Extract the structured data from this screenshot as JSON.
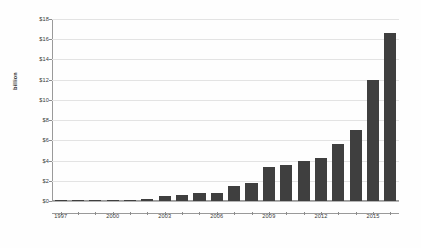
{
  "chart_data": {
    "type": "bar",
    "title": "",
    "subtitle": "",
    "xlabel": "",
    "ylabel": "billion",
    "categories": [
      "1997",
      "1998",
      "1999",
      "2000",
      "2001",
      "2002",
      "2003",
      "2004",
      "2005",
      "2006",
      "2007",
      "2008",
      "2009",
      "2010",
      "2011",
      "2012",
      "2013",
      "2014",
      "2015",
      "2016"
    ],
    "values": [
      0.05,
      0.02,
      0.03,
      0.03,
      0.03,
      0.2,
      0.45,
      0.55,
      0.8,
      0.75,
      1.5,
      1.8,
      3.4,
      3.55,
      4.0,
      4.3,
      5.6,
      7.0,
      12.0,
      16.6
    ],
    "series": [
      {
        "name": "billion",
        "values": [
          0.05,
          0.02,
          0.03,
          0.03,
          0.03,
          0.2,
          0.45,
          0.55,
          0.8,
          0.75,
          1.5,
          1.8,
          3.4,
          3.55,
          4.0,
          4.3,
          5.6,
          7.0,
          12.0,
          16.6
        ]
      }
    ],
    "ylim": [
      0,
      18
    ],
    "ytick_values": [
      0,
      2,
      4,
      6,
      8,
      10,
      12,
      14,
      16,
      18
    ],
    "ytick_labels": [
      "$0",
      "$2",
      "$4",
      "$6",
      "$8",
      "$10",
      "$12",
      "$14",
      "$16",
      "$18"
    ],
    "xtick_labels": [
      "1997",
      "2000",
      "2003",
      "2006",
      "2009",
      "2012",
      "2015"
    ],
    "xtick_categories": [
      "1997",
      "2000",
      "2003",
      "2006",
      "2009",
      "2012",
      "2015"
    ],
    "grid": true,
    "grid_axis": "y",
    "legend": false,
    "legend_position": "none",
    "bar_color": "#3f3f3f",
    "grid_color": "#e3e3e3",
    "axis_color": "#9a9a9a",
    "background_color": "#fefefe",
    "annotations": []
  }
}
